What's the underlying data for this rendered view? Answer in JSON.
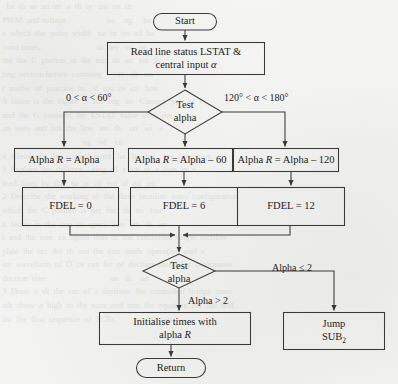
{
  "figure": {
    "type": "flowchart",
    "stroke_color": "#3a3a3a",
    "text_color": "#1d1d1d",
    "page_color": "#f4f4f2"
  },
  "nodes": {
    "start": {
      "shape": "terminator",
      "label": "Start"
    },
    "read_input": {
      "shape": "process",
      "line1": "Read line status   LSTAT  &",
      "line2_pre": "central input  ",
      "line2_sym": "α"
    },
    "test_alpha_1": {
      "shape": "decision",
      "line1": "Test",
      "line2": "alpha"
    },
    "alpha_r_left": {
      "shape": "process",
      "pre": "Alpha ",
      "var": "R",
      "post": " = Alpha"
    },
    "alpha_r_mid": {
      "shape": "process",
      "pre": "Alpha ",
      "var": "R",
      "post": " = Alpha – 60"
    },
    "alpha_r_right": {
      "shape": "process",
      "pre": "Alpha ",
      "var": "R",
      "post": " = Alpha – 120"
    },
    "fdel_left": {
      "shape": "process",
      "label": "FDEL = 0"
    },
    "fdel_mid": {
      "shape": "process",
      "label": "FDEL = 6"
    },
    "fdel_right": {
      "shape": "process",
      "label": "FDEL = 12"
    },
    "test_alpha_2": {
      "shape": "decision",
      "line1": "Test",
      "line2": "alpha"
    },
    "initialise": {
      "shape": "process",
      "line1": "Initialise times with",
      "line2_pre": "alpha ",
      "line2_var": "R"
    },
    "jump_sub": {
      "shape": "process",
      "line1": "Jump",
      "line2_pre": "SUB",
      "line2_sub": "2"
    },
    "return": {
      "shape": "terminator",
      "label": "Return"
    }
  },
  "edge_labels": {
    "branch_left": "0 < α < 60°",
    "branch_right": "120° < α < 180°",
    "alpha_le_2": "Alpha  ≤ 2",
    "alpha_gt_2": "Alpha  > 2"
  }
}
